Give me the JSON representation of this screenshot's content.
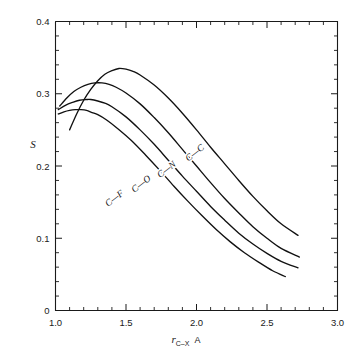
{
  "chart_data": {
    "type": "line",
    "title": "",
    "xlabel": "r_C-X  A",
    "xlabel_main": "r",
    "xlabel_sub": "C–X",
    "xlabel_unit": "A",
    "ylabel": "S",
    "xlim": [
      1.0,
      3.0
    ],
    "ylim": [
      0.0,
      0.4
    ],
    "grid": false,
    "legend_position": "inline-curve-labels",
    "x_ticks_major": [
      "1.0",
      "1.5",
      "2.0",
      "2.5",
      "3.0"
    ],
    "x_ticks_major_values": [
      1.0,
      1.5,
      2.0,
      2.5,
      3.0
    ],
    "x_tick_minor_step": 0.1,
    "y_ticks_major": [
      "0",
      "0.1",
      "0.2",
      "0.3",
      "0.4"
    ],
    "y_ticks_major_values": [
      0,
      0.1,
      0.2,
      0.3,
      0.4
    ],
    "y_tick_minor_step": 0.02,
    "series": [
      {
        "name": "C—C",
        "label": "C—C",
        "peak_x": 1.45,
        "peak_y": 0.335,
        "x": [
          1.1,
          1.15,
          1.2,
          1.25,
          1.3,
          1.35,
          1.4,
          1.45,
          1.5,
          1.55,
          1.6,
          1.7,
          1.8,
          1.9,
          2.0,
          2.1,
          2.2,
          2.3,
          2.4,
          2.5,
          2.6,
          2.72
        ],
        "values": [
          0.25,
          0.272,
          0.291,
          0.306,
          0.318,
          0.327,
          0.332,
          0.335,
          0.334,
          0.331,
          0.326,
          0.312,
          0.294,
          0.273,
          0.25,
          0.226,
          0.203,
          0.18,
          0.158,
          0.138,
          0.12,
          0.104
        ]
      },
      {
        "name": "C—N",
        "label": "C—N",
        "peak_x": 1.33,
        "peak_y": 0.315,
        "x": [
          1.03,
          1.08,
          1.13,
          1.18,
          1.23,
          1.28,
          1.33,
          1.38,
          1.43,
          1.5,
          1.6,
          1.7,
          1.8,
          1.9,
          2.0,
          2.1,
          2.2,
          2.3,
          2.4,
          2.5,
          2.6,
          2.73
        ],
        "values": [
          0.283,
          0.294,
          0.303,
          0.309,
          0.313,
          0.315,
          0.315,
          0.313,
          0.309,
          0.301,
          0.286,
          0.267,
          0.246,
          0.223,
          0.2,
          0.177,
          0.155,
          0.135,
          0.116,
          0.1,
          0.086,
          0.074
        ]
      },
      {
        "name": "C—O",
        "label": "C—O",
        "peak_x": 1.25,
        "peak_y": 0.292,
        "x": [
          1.02,
          1.07,
          1.12,
          1.17,
          1.22,
          1.25,
          1.3,
          1.35,
          1.4,
          1.5,
          1.6,
          1.7,
          1.8,
          1.9,
          2.0,
          2.1,
          2.2,
          2.3,
          2.4,
          2.5,
          2.6,
          2.72
        ],
        "values": [
          0.278,
          0.284,
          0.288,
          0.291,
          0.292,
          0.292,
          0.29,
          0.287,
          0.282,
          0.268,
          0.25,
          0.23,
          0.208,
          0.186,
          0.165,
          0.144,
          0.125,
          0.107,
          0.092,
          0.079,
          0.068,
          0.059
        ]
      },
      {
        "name": "C—F",
        "label": "C—F",
        "peak_x": 1.18,
        "peak_y": 0.278,
        "x": [
          1.02,
          1.06,
          1.1,
          1.14,
          1.18,
          1.22,
          1.26,
          1.3,
          1.36,
          1.44,
          1.54,
          1.64,
          1.74,
          1.84,
          1.94,
          2.04,
          2.14,
          2.24,
          2.34,
          2.44,
          2.54,
          2.63
        ],
        "values": [
          0.272,
          0.275,
          0.277,
          0.278,
          0.278,
          0.277,
          0.274,
          0.271,
          0.264,
          0.252,
          0.235,
          0.215,
          0.194,
          0.172,
          0.151,
          0.131,
          0.112,
          0.095,
          0.08,
          0.067,
          0.055,
          0.047
        ]
      }
    ],
    "annotations": [
      {
        "text": "C—C",
        "x": 2.0,
        "y": 0.215,
        "rotation": -38
      },
      {
        "text": "C—N",
        "x": 1.8,
        "y": 0.192,
        "rotation": -38
      },
      {
        "text": "C—O",
        "x": 1.62,
        "y": 0.172,
        "rotation": -38
      },
      {
        "text": "C—F",
        "x": 1.43,
        "y": 0.152,
        "rotation": -38
      }
    ],
    "colors": {
      "curve": "#111111",
      "axis": "#1a1a1a",
      "background": "#ffffff"
    }
  }
}
